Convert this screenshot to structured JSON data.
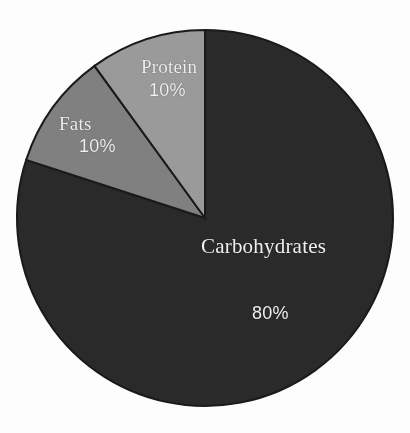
{
  "chart_data": {
    "type": "pie",
    "title": "",
    "subtitle": "",
    "xlabel": "",
    "ylabel": "",
    "legend_position": "none",
    "labels_inside_slices": true,
    "categories": [
      "Carbohydrates",
      "Fats",
      "Protein"
    ],
    "values": [
      80,
      10,
      10
    ],
    "unit": "%",
    "slices": [
      {
        "name": "Carbohydrates",
        "value": 80,
        "value_label": "80%",
        "color": "#2a2a2a",
        "start_angle_deg": 0,
        "end_angle_deg": 288
      },
      {
        "name": "Fats",
        "value": 10,
        "value_label": "10%",
        "color": "#808080",
        "start_angle_deg": 288,
        "end_angle_deg": 324
      },
      {
        "name": "Protein",
        "value": 10,
        "value_label": "10%",
        "color": "#9a9a9a",
        "start_angle_deg": 324,
        "end_angle_deg": 360
      }
    ],
    "total": 100,
    "start_angle_deg": 0,
    "direction": "clockwise"
  },
  "figure": {
    "background_color": "#fdfdfd",
    "slice_border_color": "#1a1a1a",
    "label_text_color": "#f2f0ec",
    "center_x": 205,
    "center_y": 218,
    "radius": 188
  },
  "labels": {
    "protein": {
      "name": "Protein",
      "percent": "10%"
    },
    "fats": {
      "name": "Fats",
      "percent": "10%"
    },
    "carbohydrates": {
      "name": "Carbohydrates",
      "percent": "80%"
    }
  }
}
